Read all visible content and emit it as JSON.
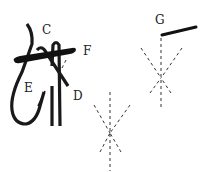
{
  "diagram": {
    "labels": {
      "c": "C",
      "f": "F",
      "e": "E",
      "d": "D",
      "g": "G"
    },
    "colors": {
      "ink": "#1a1a1a",
      "background": "#ffffff"
    }
  }
}
